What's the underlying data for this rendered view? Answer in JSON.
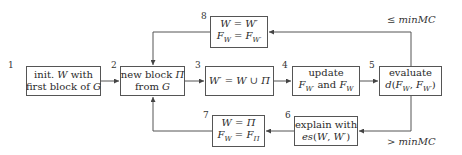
{
  "diagram": {
    "type": "flowchart",
    "nodes": [
      {
        "id": "1",
        "number": "1",
        "lines": [
          "init. W with",
          "first block of G"
        ]
      },
      {
        "id": "2",
        "number": "2",
        "lines": [
          "new block Π",
          "from G"
        ]
      },
      {
        "id": "3",
        "number": "3",
        "lines": [
          "W′ = W ∪ Π"
        ]
      },
      {
        "id": "4",
        "number": "4",
        "lines": [
          "update",
          "F_W′ and F_W"
        ]
      },
      {
        "id": "5",
        "number": "5",
        "lines": [
          "evaluate",
          "d(F_W, F_W′)"
        ]
      },
      {
        "id": "6",
        "number": "6",
        "lines": [
          "explain with",
          "es(W, W′)"
        ]
      },
      {
        "id": "7",
        "number": "7",
        "lines": [
          "W = Π",
          "F_W = F_Π"
        ]
      },
      {
        "id": "8",
        "number": "8",
        "lines": [
          "W = W′",
          "F_W = F_W′"
        ]
      }
    ],
    "edges": [
      {
        "from": "1",
        "to": "2"
      },
      {
        "from": "2",
        "to": "3"
      },
      {
        "from": "3",
        "to": "4"
      },
      {
        "from": "4",
        "to": "5"
      },
      {
        "from": "5",
        "to": "8",
        "label": "≤ minMC"
      },
      {
        "from": "5",
        "to": "6",
        "label": "> minMC"
      },
      {
        "from": "6",
        "to": "7"
      },
      {
        "from": "8",
        "to": "2"
      },
      {
        "from": "7",
        "to": "2"
      }
    ],
    "conditions": {
      "upper": "≤ minMC",
      "lower": "> minMC"
    }
  },
  "colors": {
    "line": "#555555",
    "text": "#2a2a2a",
    "background": "#ffffff"
  }
}
